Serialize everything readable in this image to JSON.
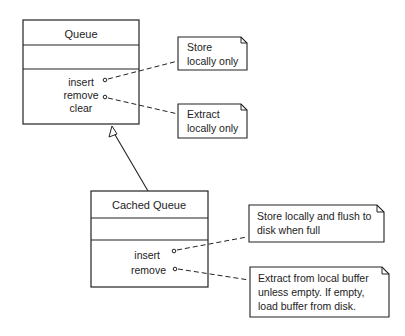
{
  "queue": {
    "name": "Queue",
    "operations": [
      "insert",
      "remove",
      "clear"
    ]
  },
  "cached_queue": {
    "name": "Cached Queue",
    "operations": [
      "insert",
      "remove"
    ]
  },
  "notes": {
    "queue_insert": [
      "Store",
      "locally only"
    ],
    "queue_remove": [
      "Extract",
      "locally only"
    ],
    "cached_insert": [
      "Store locally and flush to",
      "disk when full"
    ],
    "cached_remove": [
      "Extract from local buffer",
      "unless empty. If empty,",
      "load buffer from disk."
    ]
  },
  "colors": {
    "stroke": "#222222",
    "background": "#ffffff"
  }
}
